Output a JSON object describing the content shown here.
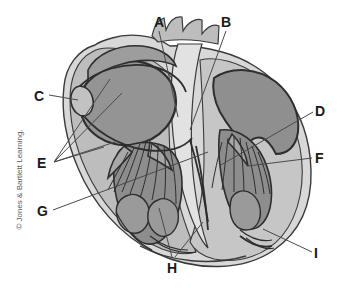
{
  "figure": {
    "kind": "anatomical-diagram",
    "copyright": "© Jones & Bartlett Learning.",
    "width": 345,
    "height": 288
  },
  "palette": {
    "background": "#ffffff",
    "outer_wall_light": "#d6d6d6",
    "myocardium_mid": "#b9b9b9",
    "chamber_dark": "#939393",
    "chamber_darker": "#8a8a8a",
    "outline": "#3a3a3a",
    "leader_line": "#4a4a4a",
    "label_text": "#1a1a1a",
    "copyright_text": "#5a5a5a"
  },
  "labels": [
    {
      "id": "A",
      "text": "A",
      "x": 154,
      "y": 15
    },
    {
      "id": "B",
      "text": "B",
      "x": 221,
      "y": 15
    },
    {
      "id": "C",
      "text": "C",
      "x": 34,
      "y": 89
    },
    {
      "id": "D",
      "text": "D",
      "x": 315,
      "y": 104
    },
    {
      "id": "E",
      "text": "E",
      "x": 37,
      "y": 156
    },
    {
      "id": "F",
      "text": "F",
      "x": 315,
      "y": 151
    },
    {
      "id": "G",
      "text": "G",
      "x": 37,
      "y": 204
    },
    {
      "id": "H",
      "text": "H",
      "x": 167,
      "y": 261
    },
    {
      "id": "I",
      "text": "I",
      "x": 314,
      "y": 246
    }
  ],
  "leader_lines": [
    {
      "for": "A",
      "x1": 159,
      "y1": 31,
      "x2": 178,
      "y2": 117
    },
    {
      "for": "B",
      "x1": 226,
      "y1": 31,
      "x2": 190,
      "y2": 130
    },
    {
      "for": "C",
      "x1": 49,
      "y1": 95,
      "x2": 78,
      "y2": 100
    },
    {
      "for": "D",
      "x1": 313,
      "y1": 112,
      "x2": 219,
      "y2": 166
    },
    {
      "for": "E",
      "x1": 54,
      "y1": 162,
      "x2": 110,
      "y2": 79
    },
    {
      "for": "E",
      "x1": 54,
      "y1": 162,
      "x2": 122,
      "y2": 93
    },
    {
      "for": "E",
      "x1": 54,
      "y1": 162,
      "x2": 118,
      "y2": 141
    },
    {
      "for": "E",
      "x1": 54,
      "y1": 162,
      "x2": 104,
      "y2": 147
    },
    {
      "for": "F",
      "x1": 312,
      "y1": 158,
      "x2": 248,
      "y2": 166
    },
    {
      "for": "G",
      "x1": 53,
      "y1": 210,
      "x2": 208,
      "y2": 152
    },
    {
      "for": "H",
      "x1": 172,
      "y1": 257,
      "x2": 159,
      "y2": 208
    },
    {
      "for": "H",
      "x1": 175,
      "y1": 257,
      "x2": 203,
      "y2": 222
    },
    {
      "for": "I",
      "x1": 312,
      "y1": 252,
      "x2": 263,
      "y2": 229
    }
  ]
}
